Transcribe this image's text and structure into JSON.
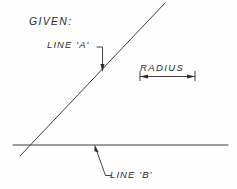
{
  "drawing": {
    "title_note": "GIVEN:",
    "background_color": "#fefefe",
    "line_color": "#3d3d3d",
    "text_color": "#2b2b2b",
    "labels": {
      "given": "GIVEN:",
      "line_a": "LINE 'A'",
      "radius": "RADIUS",
      "line_b": "LINE 'B'"
    },
    "geometry": {
      "line_a": {
        "name": "LINE 'A'",
        "type": "diagonal-line",
        "x1": 20,
        "y1": 156,
        "x2": 165,
        "y2": 3
      },
      "line_b": {
        "name": "LINE 'B'",
        "type": "horizontal-line",
        "x1": 13,
        "y1": 145,
        "x2": 228,
        "y2": 145
      },
      "intersection": {
        "x": 26,
        "y": 145
      },
      "radius_dimension": {
        "name": "RADIUS",
        "x1": 140,
        "y1": 77,
        "x2": 195,
        "y2": 77,
        "length_px": 55,
        "arrowheads": "both-ends"
      },
      "leader_line_a": {
        "points": "97,47 102,47 102,70",
        "arrow_at": {
          "x": 102,
          "y": 70
        },
        "arrow_direction": "down"
      },
      "leader_line_b": {
        "points": "95,146 105,176 112,176",
        "arrow_at": {
          "x": 95,
          "y": 146
        },
        "arrow_direction": "up"
      }
    }
  }
}
